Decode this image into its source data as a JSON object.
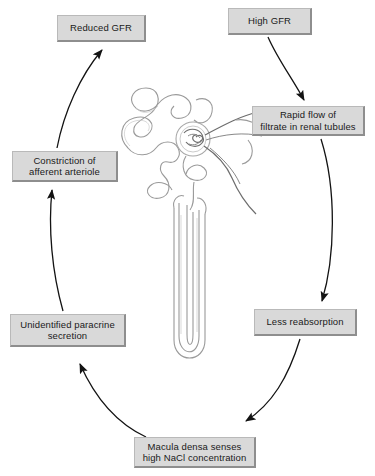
{
  "diagram": {
    "canvas": {
      "width": 375,
      "height": 476
    },
    "style": {
      "box_fill": "#d9d9d9",
      "box_border": "#b9b9b9",
      "box_shadow_edge": "#8e8e8e",
      "arrow_color": "#131313",
      "text_color": "#1a1a1a",
      "background": "#ffffff"
    },
    "nodes": [
      {
        "id": "reduced_gfr",
        "label": "Reduced GFR"
      },
      {
        "id": "high_gfr",
        "label": "High GFR"
      },
      {
        "id": "rapid_flow",
        "label": "Rapid flow of\nfiltrate in renal tubules"
      },
      {
        "id": "constriction",
        "label": "Constriction of\nafferent arteriole"
      },
      {
        "id": "less_reabs",
        "label": "Less reabsorption"
      },
      {
        "id": "paracrine",
        "label": "Unidentified paracrine\nsecretion"
      },
      {
        "id": "macula_densa",
        "label": "Macula densa senses\nhigh NaCl concentration"
      }
    ],
    "edges": [
      {
        "from": "high_gfr",
        "to": "rapid_flow",
        "name": "arrow-high-gfr-to-rapid-flow"
      },
      {
        "from": "rapid_flow",
        "to": "less_reabs",
        "name": "arrow-rapid-flow-to-less-reabsorption"
      },
      {
        "from": "less_reabs",
        "to": "macula_densa",
        "name": "arrow-less-reabsorption-to-macula-densa"
      },
      {
        "from": "macula_densa",
        "to": "paracrine",
        "name": "arrow-macula-densa-to-paracrine"
      },
      {
        "from": "paracrine",
        "to": "constriction",
        "name": "arrow-paracrine-to-constriction"
      },
      {
        "from": "constriction",
        "to": "reduced_gfr",
        "name": "arrow-constriction-to-reduced-gfr"
      }
    ],
    "illustration": {
      "name": "nephron-illustration",
      "description": "Nephron with glomerulus, convoluted tubules and loop of Henle"
    }
  }
}
